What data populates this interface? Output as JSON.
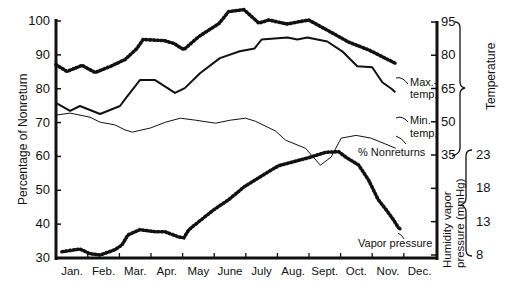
{
  "chart_data": {
    "type": "line",
    "title": "",
    "xlabel": "",
    "ylabel": "Percentage of Nonreturn",
    "y2label": "Temperature",
    "y3label": "Humidity vapor pressure (mmHg)",
    "categories": [
      "Jan.",
      "Feb.",
      "Mar.",
      "Apr.",
      "May",
      "June",
      "July",
      "Aug.",
      "Sept.",
      "Oct.",
      "Nov.",
      "Dec."
    ],
    "ylim": [
      30,
      100
    ],
    "yticks": [
      100,
      90,
      80,
      70,
      60,
      50,
      40,
      30
    ],
    "y2lim": [
      35,
      95
    ],
    "y2ticks": [
      95,
      80,
      65,
      50,
      35
    ],
    "y3lim": [
      8,
      23
    ],
    "y3ticks": [
      23,
      18,
      13,
      8
    ],
    "grid": false,
    "series": [
      {
        "name": "Max. temp.",
        "axis": "temperature",
        "style": "dotted-thick",
        "x": [
          0.49,
          0.84,
          1.32,
          1.73,
          2.2,
          2.68,
          3.05,
          3.25,
          3.91,
          4.23,
          4.38,
          4.54,
          5.01,
          5.65,
          5.96,
          6.44,
          6.91,
          7.23,
          7.8,
          8.49,
          9.12,
          9.75,
          10.39,
          11.02,
          11.27
        ],
        "values": [
          75.8,
          72.7,
          75.4,
          72.2,
          74.9,
          78.1,
          83,
          87.1,
          86.6,
          85.3,
          83.9,
          82.6,
          88.4,
          94.3,
          99.7,
          100.6,
          94.5,
          95.9,
          94.1,
          95.9,
          91,
          86,
          82.4,
          77.9,
          76.1
        ]
      },
      {
        "name": "Min. temp.",
        "axis": "temperature",
        "style": "solid-thick",
        "x": [
          0.49,
          0.94,
          1.25,
          1.89,
          2.52,
          2.68,
          3.15,
          3.63,
          4.26,
          4.57,
          5.05,
          5.68,
          6.31,
          6.78,
          7.0,
          7.82,
          8.13,
          8.45,
          9.08,
          9.55,
          10.03,
          10.5,
          10.82,
          11.13,
          11.23
        ],
        "values": [
          58.5,
          54.9,
          57.1,
          53.5,
          57.1,
          60.2,
          68.8,
          68.8,
          63,
          65.2,
          71.9,
          78.7,
          81.8,
          83.1,
          87.1,
          88,
          87.1,
          88,
          86.2,
          81.8,
          75,
          74.6,
          67.8,
          64.7,
          63.3
        ]
      },
      {
        "name": "% Nonreturns",
        "axis": "percentage",
        "style": "solid-thin",
        "x": [
          0.49,
          0.94,
          1.57,
          1.89,
          2.36,
          2.68,
          2.91,
          3.48,
          3.96,
          4.43,
          4.91,
          5.54,
          6.01,
          6.49,
          6.8,
          7.44,
          7.76,
          8.39,
          8.86,
          9.2,
          9.52,
          9.99,
          10.46,
          11.25
        ],
        "values": [
          72.2,
          72.8,
          71.6,
          70.1,
          69.3,
          67.8,
          67.2,
          68.4,
          70.1,
          71.3,
          70.7,
          69.8,
          70.7,
          71.3,
          70.4,
          67.5,
          64.8,
          62.4,
          57.4,
          59.8,
          65.4,
          66.2,
          65.4,
          62.4
        ]
      },
      {
        "name": "Vapor pressure",
        "axis": "vapor",
        "style": "dotted-thick",
        "x": [
          0.68,
          1.25,
          1.57,
          1.89,
          2.36,
          2.58,
          2.77,
          3.15,
          3.63,
          3.94,
          4.38,
          4.54,
          4.7,
          5.01,
          5.49,
          5.96,
          6.44,
          6.91,
          7.32,
          7.54,
          8.01,
          8.49,
          9.03,
          9.44,
          9.69,
          10.07,
          10.38,
          10.69,
          10.94,
          11.17,
          11.33,
          11.42
        ],
        "values": [
          8.5,
          8.9,
          8.2,
          8.0,
          8.8,
          9.5,
          11.0,
          11.8,
          11.5,
          11.5,
          10.7,
          10.6,
          11.8,
          13.0,
          14.8,
          16.3,
          18.2,
          19.6,
          20.8,
          21.4,
          22.0,
          22.6,
          23.4,
          23.5,
          22.6,
          21.5,
          19.3,
          16.3,
          14.8,
          13.3,
          12.1,
          11.8
        ]
      }
    ],
    "annotations": [
      "Max.- temp.",
      "Min.- temp.",
      "% Nonreturns",
      "Vapor pressure"
    ]
  },
  "labels": {
    "left_axis_title": "Percentage of Nonreturn",
    "right_axis_temp_title": "Temperature",
    "right_axis_vapor_title_1": "Humidity vapor",
    "right_axis_vapor_title_2": "pressure (mmHg)",
    "max_temp_1": "Max.-",
    "max_temp_2": "temp.",
    "min_temp_1": "Min.-",
    "min_temp_2": "temp.",
    "nonreturns": "% Nonreturns",
    "vapor": "Vapor pressure"
  }
}
